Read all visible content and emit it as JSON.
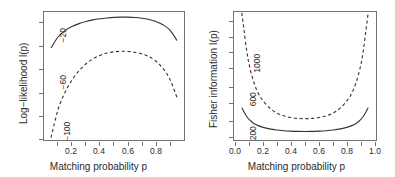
{
  "figure": {
    "background": "#ffffff",
    "line_color": "#333333",
    "frame_color": "#737373"
  },
  "chart_data": [
    {
      "type": "line",
      "panel": "left",
      "title": "",
      "xlabel": "Matching probability p",
      "ylabel": "Log−likelihood l(p)",
      "xlim": [
        0.0,
        1.0
      ],
      "ylim": [
        -118,
        -8
      ],
      "xticks": [
        0.2,
        0.4,
        0.6,
        0.8
      ],
      "xticklabels": [
        "0.2",
        "0.4",
        "0.6",
        "0.8"
      ],
      "xminorticks": [
        0.1,
        0.3,
        0.5,
        0.7,
        0.9
      ],
      "yticks": [
        -20,
        -60,
        -100
      ],
      "yticklabels": [
        "-20",
        "-60",
        "-100"
      ],
      "yminorticks": [
        -40,
        -80
      ],
      "grid": false,
      "legend": "none",
      "series": [
        {
          "name": "solid-curve",
          "style": "solid",
          "x": [
            0.05,
            0.1,
            0.15,
            0.2,
            0.25,
            0.3,
            0.35,
            0.4,
            0.45,
            0.5,
            0.55,
            0.6,
            0.65,
            0.7,
            0.75,
            0.8,
            0.85,
            0.9,
            0.95
          ],
          "y": [
            -39.0,
            -29.5,
            -24.0,
            -20.5,
            -18.0,
            -16.2,
            -14.8,
            -13.8,
            -13.1,
            -12.6,
            -12.4,
            -12.4,
            -12.7,
            -13.3,
            -14.4,
            -16.2,
            -19.0,
            -23.5,
            -32.5
          ]
        },
        {
          "name": "dashed-curve",
          "style": "dashed",
          "x": [
            0.05,
            0.1,
            0.15,
            0.2,
            0.25,
            0.3,
            0.35,
            0.4,
            0.45,
            0.5,
            0.55,
            0.6,
            0.65,
            0.7,
            0.75,
            0.8,
            0.85,
            0.9,
            0.95
          ],
          "y": [
            -116.0,
            -92.0,
            -77.0,
            -66.5,
            -58.5,
            -52.5,
            -48.3,
            -45.3,
            -43.3,
            -42.2,
            -41.8,
            -41.9,
            -42.6,
            -44.0,
            -46.4,
            -50.3,
            -56.5,
            -66.0,
            -81.5
          ]
        }
      ]
    },
    {
      "type": "line",
      "panel": "right",
      "title": "",
      "xlabel": "Matching probability p",
      "ylabel": "Fisher information I(p)",
      "xlim": [
        0.0,
        1.0
      ],
      "ylim": [
        60,
        1530
      ],
      "xticks": [
        0.0,
        0.2,
        0.4,
        0.6,
        0.8,
        1.0
      ],
      "xticklabels": [
        "0.0",
        "0.2",
        "0.4",
        "0.6",
        "0.8",
        "1.0"
      ],
      "xminorticks": [
        0.1,
        0.3,
        0.5,
        0.7,
        0.9
      ],
      "yticks": [
        200,
        600,
        1000
      ],
      "yticklabels": [
        "200",
        "600",
        "1000"
      ],
      "yminorticks": [
        400,
        800,
        1200,
        1400
      ],
      "grid": false,
      "legend": "none",
      "series": [
        {
          "name": "solid-curve",
          "style": "solid",
          "x": [
            0.055,
            0.07,
            0.09,
            0.11,
            0.14,
            0.17,
            0.2,
            0.25,
            0.3,
            0.35,
            0.4,
            0.45,
            0.5,
            0.55,
            0.6,
            0.65,
            0.7,
            0.75,
            0.8,
            0.83,
            0.86,
            0.89,
            0.91,
            0.93,
            0.945
          ],
          "y": [
            430,
            385,
            330,
            290,
            250,
            225,
            208,
            188,
            175,
            167,
            162,
            159,
            158,
            159,
            162,
            167,
            175,
            188,
            208,
            225,
            250,
            290,
            330,
            385,
            430
          ]
        },
        {
          "name": "dashed-curve",
          "style": "dashed",
          "x": [
            0.055,
            0.07,
            0.09,
            0.11,
            0.14,
            0.17,
            0.2,
            0.25,
            0.3,
            0.35,
            0.4,
            0.45,
            0.5,
            0.55,
            0.6,
            0.65,
            0.7,
            0.75,
            0.8,
            0.83,
            0.86,
            0.89,
            0.91,
            0.93,
            0.945
          ],
          "y": [
            1520,
            1330,
            1080,
            900,
            720,
            600,
            520,
            430,
            370,
            338,
            318,
            308,
            305,
            308,
            318,
            338,
            370,
            430,
            520,
            600,
            720,
            900,
            1080,
            1330,
            1520
          ]
        }
      ]
    }
  ],
  "panels": {
    "left": {
      "xtitle": "Matching probability p",
      "ytitle": "Log−likelihood l(p)",
      "xticklabels": [
        "0.2",
        "0.4",
        "0.6",
        "0.8"
      ],
      "yticklabels": [
        "−20",
        "−60",
        "−100"
      ]
    },
    "right": {
      "xtitle": "Matching probability p",
      "ytitle": "Fisher information I(p)",
      "xticklabels": [
        "0.0",
        "0.2",
        "0.4",
        "0.6",
        "0.8",
        "1.0"
      ],
      "yticklabels": [
        "200",
        "600",
        "1000"
      ]
    }
  }
}
